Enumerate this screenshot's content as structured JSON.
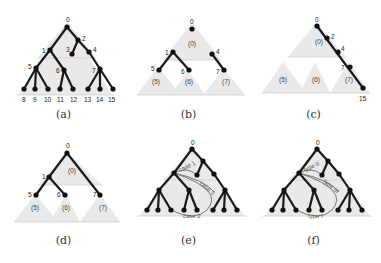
{
  "figure": {
    "panels": [
      {
        "id": "a",
        "caption": "(a)",
        "origin": [
          0,
          0
        ],
        "triangles": [
          {
            "points": "67,22 18,95 112,95"
          },
          {
            "points": "67,22 38,58 96,58"
          }
        ],
        "baselines": [
          [
            16,
            95,
            114,
            95
          ],
          [
            38,
            58,
            96,
            58
          ]
        ],
        "edges": [
          [
            67,
            27,
            50,
            50
          ],
          [
            67,
            27,
            78,
            40
          ],
          [
            78,
            40,
            72,
            54
          ],
          [
            78,
            40,
            89,
            52
          ],
          [
            50,
            50,
            36,
            68
          ],
          [
            50,
            50,
            64,
            70
          ],
          [
            89,
            52,
            100,
            69
          ],
          [
            36,
            68,
            24,
            89
          ],
          [
            36,
            68,
            35,
            89
          ],
          [
            36,
            68,
            48,
            89
          ],
          [
            64,
            70,
            60,
            89
          ],
          [
            64,
            70,
            73,
            89
          ],
          [
            100,
            69,
            88,
            89
          ],
          [
            100,
            69,
            100,
            89
          ],
          [
            100,
            69,
            113,
            89
          ]
        ],
        "nodes": [
          {
            "x": 67,
            "y": 27,
            "label": "0",
            "lx": 66,
            "ly": 20
          },
          {
            "x": 50,
            "y": 50,
            "label": "1",
            "lx": 42,
            "ly": 51
          },
          {
            "x": 78,
            "y": 40,
            "label": "2",
            "lx": 82,
            "ly": 39
          },
          {
            "x": 72,
            "y": 54,
            "label": "3",
            "lx": 66,
            "ly": 50
          },
          {
            "x": 89,
            "y": 52,
            "label": "4",
            "lx": 93,
            "ly": 50
          },
          {
            "x": 36,
            "y": 68,
            "label": "5",
            "lx": 28,
            "ly": 67
          },
          {
            "x": 64,
            "y": 70,
            "label": "6",
            "lx": 56,
            "ly": 71
          },
          {
            "x": 100,
            "y": 69,
            "label": "7",
            "lx": 92,
            "ly": 71
          },
          {
            "x": 24,
            "y": 89,
            "label": "8",
            "lx": 22,
            "ly": 100
          },
          {
            "x": 35,
            "y": 89,
            "label": "9",
            "lx": 33,
            "ly": 100
          },
          {
            "x": 48,
            "y": 89,
            "label": "10",
            "lx": 44,
            "ly": 100
          },
          {
            "x": 60,
            "y": 89,
            "label": "11",
            "lx": 57,
            "ly": 100
          },
          {
            "x": 73,
            "y": 89,
            "label": "12",
            "lx": 70,
            "ly": 100
          },
          {
            "x": 88,
            "y": 89,
            "label": "13",
            "lx": 84,
            "ly": 100
          },
          {
            "x": 100,
            "y": 89,
            "label": "14",
            "lx": 96,
            "ly": 100
          },
          {
            "x": 113,
            "y": 89,
            "label": "15",
            "lx": 108,
            "ly": 100
          }
        ],
        "sublabels": [],
        "curves": []
      },
      {
        "id": "b",
        "caption": "(b)",
        "origin": [
          125,
          0
        ],
        "triangles": [
          {
            "points": "67,22 38,60 96,60"
          },
          {
            "points": "33,67 12,95 56,95"
          },
          {
            "points": "63,70 46,95 80,95"
          },
          {
            "points": "99,68 78,95 120,95"
          }
        ],
        "baselines": [
          [
            12,
            95,
            120,
            95
          ],
          [
            38,
            60,
            96,
            60
          ]
        ],
        "edges": [
          [
            48,
            52,
            34,
            70
          ],
          [
            48,
            52,
            64,
            70
          ],
          [
            87,
            54,
            99,
            70
          ]
        ],
        "nodes": [
          {
            "x": 67,
            "y": 29,
            "label": "0",
            "lx": 65,
            "ly": 22
          },
          {
            "x": 48,
            "y": 52,
            "label": "1",
            "lx": 40,
            "ly": 53
          },
          {
            "x": 87,
            "y": 54,
            "label": "4",
            "lx": 91,
            "ly": 52
          },
          {
            "x": 34,
            "y": 70,
            "label": "5",
            "lx": 26,
            "ly": 69
          },
          {
            "x": 64,
            "y": 70,
            "label": "6",
            "lx": 56,
            "ly": 72
          },
          {
            "x": 99,
            "y": 70,
            "label": "7",
            "lx": 91,
            "ly": 72
          }
        ],
        "sublabels": [
          {
            "text": "(0)",
            "x": 63,
            "y": 46
          },
          {
            "text": "(5)",
            "x": 27,
            "y": 84
          },
          {
            "text": "(6)",
            "x": 60,
            "y": 84
          },
          {
            "text": "(7)",
            "x": 97,
            "y": 84
          }
        ],
        "curves": []
      },
      {
        "id": "c",
        "caption": "(c)",
        "origin": [
          250,
          0
        ],
        "triangles": [
          {
            "points": "67,22 38,57 96,57"
          },
          {
            "points": "33,62 12,93 56,93"
          },
          {
            "points": "65,62 50,93 80,93"
          },
          {
            "points": "99,62 80,93 120,93"
          }
        ],
        "baselines": [
          [
            12,
            93,
            120,
            93
          ],
          [
            38,
            57,
            96,
            57
          ]
        ],
        "edges": [
          [
            67,
            26,
            113,
            88
          ]
        ],
        "nodes": [
          {
            "x": 67,
            "y": 26,
            "label": "0",
            "lx": 65,
            "ly": 20
          },
          {
            "x": 77,
            "y": 38,
            "label": "2",
            "lx": 81,
            "ly": 37
          },
          {
            "x": 88,
            "y": 52,
            "label": "4",
            "lx": 91,
            "ly": 49
          },
          {
            "x": 100,
            "y": 67,
            "label": "7",
            "lx": 91,
            "ly": 68
          },
          {
            "x": 113,
            "y": 88,
            "label": "15",
            "lx": 109,
            "ly": 99
          }
        ],
        "sublabels": [
          {
            "text": "(0)",
            "x": 65,
            "y": 44
          },
          {
            "text": "(5)",
            "x": 29,
            "y": 82
          },
          {
            "text": "(6)",
            "x": 62,
            "y": 82
          },
          {
            "text": "(7)",
            "x": 95,
            "y": 82
          }
        ],
        "curves": []
      },
      {
        "id": "d",
        "caption": "(d)",
        "origin": [
          0,
          130
        ],
        "triangles": [
          {
            "points": "67,23 38,55 102,55"
          },
          {
            "points": "35,64 14,92 58,92"
          },
          {
            "points": "66,64 50,92 80,92"
          },
          {
            "points": "100,64 80,92 120,92"
          }
        ],
        "baselines": [
          [
            14,
            92,
            120,
            92
          ],
          [
            38,
            55,
            102,
            55
          ]
        ],
        "edges": [
          [
            67,
            23,
            49,
            47
          ],
          [
            67,
            23,
            100,
            65
          ],
          [
            49,
            47,
            36,
            65
          ],
          [
            49,
            47,
            65,
            65
          ]
        ],
        "nodes": [
          {
            "x": 67,
            "y": 23,
            "label": "0",
            "lx": 66,
            "ly": 16
          },
          {
            "x": 49,
            "y": 47,
            "label": "1",
            "lx": 42,
            "ly": 47
          },
          {
            "x": 36,
            "y": 65,
            "label": "5",
            "lx": 28,
            "ly": 65
          },
          {
            "x": 65,
            "y": 65,
            "label": "6",
            "lx": 57,
            "ly": 65
          },
          {
            "x": 100,
            "y": 65,
            "label": "7",
            "lx": 93,
            "ly": 65
          }
        ],
        "sublabels": [
          {
            "text": "(0)",
            "x": 68,
            "y": 43
          },
          {
            "text": "(5)",
            "x": 31,
            "y": 80
          },
          {
            "text": "(6)",
            "x": 62,
            "y": 80
          },
          {
            "text": "(7)",
            "x": 99,
            "y": 80
          }
        ],
        "curves": []
      },
      {
        "id": "e",
        "caption": "(e)",
        "origin": [
          125,
          130
        ],
        "triangles": [
          {
            "points": "67,19 14,86 120,86"
          },
          {
            "points": "67,19 38,50 96,50"
          }
        ],
        "baselines": [
          [
            12,
            86,
            122,
            86
          ],
          [
            38,
            50,
            96,
            50
          ]
        ],
        "edges": [
          [
            67,
            19,
            49,
            43
          ],
          [
            67,
            19,
            78,
            31
          ],
          [
            78,
            31,
            72,
            45
          ],
          [
            78,
            31,
            89,
            44
          ],
          [
            49,
            43,
            34,
            60
          ],
          [
            49,
            43,
            64,
            60
          ],
          [
            89,
            44,
            100,
            60
          ],
          [
            34,
            60,
            22,
            80
          ],
          [
            34,
            60,
            33,
            80
          ],
          [
            34,
            60,
            46,
            80
          ],
          [
            64,
            60,
            59,
            80
          ],
          [
            64,
            60,
            72,
            80
          ],
          [
            100,
            60,
            88,
            80
          ],
          [
            100,
            60,
            99,
            80
          ],
          [
            100,
            60,
            112,
            80
          ]
        ],
        "nodes": [
          {
            "x": 67,
            "y": 19,
            "label": "0",
            "lx": 66,
            "ly": 13
          },
          {
            "x": 49,
            "y": 43,
            "label": "",
            "lx": 0,
            "ly": 0
          },
          {
            "x": 78,
            "y": 31,
            "label": "",
            "lx": 0,
            "ly": 0
          },
          {
            "x": 72,
            "y": 45,
            "label": "",
            "lx": 0,
            "ly": 0
          },
          {
            "x": 89,
            "y": 44,
            "label": "",
            "lx": 0,
            "ly": 0
          },
          {
            "x": 34,
            "y": 60,
            "label": "",
            "lx": 0,
            "ly": 0
          },
          {
            "x": 64,
            "y": 60,
            "label": "",
            "lx": 0,
            "ly": 0
          },
          {
            "x": 100,
            "y": 60,
            "label": "",
            "lx": 0,
            "ly": 0
          },
          {
            "x": 22,
            "y": 80,
            "label": "",
            "lx": 0,
            "ly": 0
          },
          {
            "x": 33,
            "y": 80,
            "label": "",
            "lx": 0,
            "ly": 0
          },
          {
            "x": 46,
            "y": 80,
            "label": "",
            "lx": 0,
            "ly": 0
          },
          {
            "x": 59,
            "y": 80,
            "label": "",
            "lx": 0,
            "ly": 0
          },
          {
            "x": 72,
            "y": 80,
            "label": "",
            "lx": 0,
            "ly": 0
          },
          {
            "x": 88,
            "y": 80,
            "label": "",
            "lx": 0,
            "ly": 0
          },
          {
            "x": 99,
            "y": 80,
            "label": "",
            "lx": 0,
            "ly": 0
          },
          {
            "x": 112,
            "y": 80,
            "label": "",
            "lx": 0,
            "ly": 0
          }
        ],
        "sublabels": [],
        "curves": [
          {
            "d": "M49,43 Q62,36 72,45",
            "label": "case 1",
            "lx": 55,
            "ly": 42,
            "rot": -25
          },
          {
            "d": "M49,43 Q80,50 89,62",
            "label": "case 3",
            "lx": 74,
            "ly": 54,
            "rot": 40
          },
          {
            "d": "M49,43 Q100,60 82,80 Q70,92 46,80",
            "label": "case 2",
            "lx": 58,
            "ly": 88,
            "rot": 0
          }
        ]
      },
      {
        "id": "f",
        "caption": "(f)",
        "origin": [
          250,
          130
        ],
        "triangles": [
          {
            "points": "67,19 14,86 120,86"
          },
          {
            "points": "67,19 38,50 96,50"
          }
        ],
        "baselines": [
          [
            12,
            86,
            122,
            86
          ],
          [
            38,
            50,
            96,
            50
          ]
        ],
        "edges": [
          [
            67,
            19,
            49,
            43
          ],
          [
            67,
            19,
            78,
            31
          ],
          [
            78,
            31,
            72,
            45
          ],
          [
            78,
            31,
            89,
            44
          ],
          [
            49,
            43,
            34,
            60
          ],
          [
            49,
            43,
            64,
            60
          ],
          [
            89,
            44,
            100,
            60
          ],
          [
            34,
            60,
            22,
            80
          ],
          [
            34,
            60,
            33,
            80
          ],
          [
            34,
            60,
            46,
            80
          ],
          [
            64,
            60,
            59,
            80
          ],
          [
            64,
            60,
            72,
            80
          ],
          [
            100,
            60,
            88,
            80
          ],
          [
            100,
            60,
            99,
            80
          ],
          [
            100,
            60,
            112,
            80
          ]
        ],
        "nodes": [
          {
            "x": 67,
            "y": 19,
            "label": "0",
            "lx": 66,
            "ly": 13
          },
          {
            "x": 49,
            "y": 43,
            "label": "",
            "lx": 0,
            "ly": 0
          },
          {
            "x": 78,
            "y": 31,
            "label": "",
            "lx": 0,
            "ly": 0
          },
          {
            "x": 72,
            "y": 45,
            "label": "",
            "lx": 0,
            "ly": 0
          },
          {
            "x": 89,
            "y": 44,
            "label": "",
            "lx": 0,
            "ly": 0
          },
          {
            "x": 34,
            "y": 60,
            "label": "",
            "lx": 0,
            "ly": 0
          },
          {
            "x": 64,
            "y": 60,
            "label": "",
            "lx": 0,
            "ly": 0
          },
          {
            "x": 100,
            "y": 60,
            "label": "",
            "lx": 0,
            "ly": 0
          },
          {
            "x": 22,
            "y": 80,
            "label": "",
            "lx": 0,
            "ly": 0
          },
          {
            "x": 33,
            "y": 80,
            "label": "",
            "lx": 0,
            "ly": 0
          },
          {
            "x": 46,
            "y": 80,
            "label": "",
            "lx": 0,
            "ly": 0
          },
          {
            "x": 59,
            "y": 80,
            "label": "",
            "lx": 0,
            "ly": 0
          },
          {
            "x": 72,
            "y": 80,
            "label": "",
            "lx": 0,
            "ly": 0
          },
          {
            "x": 88,
            "y": 80,
            "label": "",
            "lx": 0,
            "ly": 0
          },
          {
            "x": 99,
            "y": 80,
            "label": "",
            "lx": 0,
            "ly": 0
          },
          {
            "x": 112,
            "y": 80,
            "label": "",
            "lx": 0,
            "ly": 0
          }
        ],
        "sublabels": [],
        "curves": [
          {
            "d": "M49,43 Q62,36 72,45",
            "label": "type II",
            "lx": 55,
            "ly": 42,
            "rot": -25
          },
          {
            "d": "M49,43 Q80,50 89,62",
            "label": "type III",
            "lx": 73,
            "ly": 52,
            "rot": 40
          },
          {
            "d": "M49,43 Q100,60 82,80 Q70,92 46,80",
            "label": "type I",
            "lx": 58,
            "ly": 88,
            "rot": 0
          }
        ]
      }
    ]
  }
}
